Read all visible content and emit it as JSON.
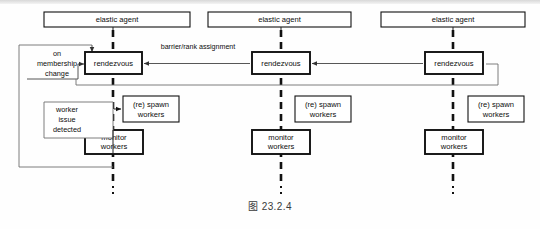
{
  "figure": {
    "caption": "图 23.2.4",
    "colors": {
      "box_stroke": "#111111",
      "note_stroke": "#6f6f6f",
      "connector": "#444444",
      "lifeline": "#111111",
      "background": "#ffffff"
    }
  },
  "labels": {
    "elastic_agent": "elastic agent",
    "rendezvous": "rendezvous",
    "respawn_workers_line1": "(re) spawn",
    "respawn_workers_line2": "workers",
    "monitor_workers_line1": "monitor",
    "monitor_workers_line2": "workers",
    "on_membership_change_line1": "on",
    "on_membership_change_line2": "membership",
    "on_membership_change_line3": "change",
    "worker_issue_detected_line1": "worker",
    "worker_issue_detected_line2": "issue",
    "worker_issue_detected_line3": "detected",
    "barrier_rank_assignment": "barrier/rank assignment"
  },
  "columns": [
    {
      "id": "agent-1",
      "agent_label": "elastic agent",
      "rendezvous_label": "rendezvous",
      "respawn_label_1": "(re) spawn",
      "respawn_label_2": "workers",
      "monitor_label_1": "monitor",
      "monitor_label_2": "workers"
    },
    {
      "id": "agent-2",
      "agent_label": "elastic agent",
      "rendezvous_label": "rendezvous",
      "respawn_label_1": "(re) spawn",
      "respawn_label_2": "workers",
      "monitor_label_1": "monitor",
      "monitor_label_2": "workers"
    },
    {
      "id": "agent-3",
      "agent_label": "elastic agent",
      "rendezvous_label": "rendezvous",
      "respawn_label_1": "(re) spawn",
      "respawn_label_2": "workers",
      "monitor_label_1": "monitor",
      "monitor_label_2": "workers"
    }
  ],
  "annotations": {
    "membership": {
      "line1": "on",
      "line2": "membership",
      "line3": "change"
    },
    "worker_issue": {
      "line1": "worker",
      "line2": "issue",
      "line3": "detected"
    },
    "edge_barrier": "barrier/rank assignment"
  }
}
